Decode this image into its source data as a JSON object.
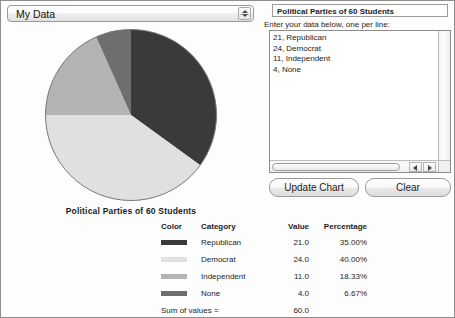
{
  "window": {
    "title": "My Data"
  },
  "data_selector": {
    "label": "My Data",
    "stepper_up_icon": "stepper-up-arrow-icon",
    "stepper_down_icon": "stepper-down-arrow-icon"
  },
  "chart": {
    "caption": "Political Parties of 60 Students"
  },
  "editor": {
    "title_value": "Political Parties of 60 Students",
    "title_placeholder": "Chart title",
    "hint": "Enter your data below, one per line:",
    "textarea_value": "21, Republican\n24, Democrat\n11, Independent\n4, None",
    "textarea_placeholder": "value, label",
    "scroll_left_icon": "scroll-left-arrow-icon",
    "scroll_right_icon": "scroll-right-arrow-icon"
  },
  "buttons": {
    "update": "Update Chart",
    "clear": "Clear"
  },
  "legend": {
    "headers": {
      "color": "Color",
      "category": "Category",
      "value": "Value",
      "percentage": "Percentage"
    },
    "rows": [
      {
        "category": "Republican",
        "value": "21.0",
        "percentage": "35.00%",
        "color": "#3a3a3a"
      },
      {
        "category": "Democrat",
        "value": "24.0",
        "percentage": "40.00%",
        "color": "#e0e0e0"
      },
      {
        "category": "Independent",
        "value": "11.0",
        "percentage": "18.33%",
        "color": "#b4b4b4"
      },
      {
        "category": "None",
        "value": "4.0",
        "percentage": "6.67%",
        "color": "#6e6e6e"
      }
    ],
    "sum_label": "Sum of values =",
    "sum_value": "60.0"
  },
  "chart_data": {
    "type": "pie",
    "title": "Political Parties of 60 Students",
    "categories": [
      "Republican",
      "Democrat",
      "Independent",
      "None"
    ],
    "values": [
      21.0,
      24.0,
      11.0,
      4.0
    ],
    "percentages": [
      35.0,
      40.0,
      18.33,
      6.67
    ],
    "colors": [
      "#3a3a3a",
      "#e0e0e0",
      "#b4b4b4",
      "#6e6e6e"
    ],
    "total": 60.0,
    "start_angle_deg": -90,
    "direction": "clockwise",
    "legend": "below-chart-table",
    "grid": false
  }
}
